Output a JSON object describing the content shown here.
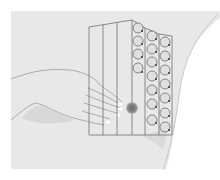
{
  "illustration": {
    "subject": "breast self-examination vertical strip pattern",
    "background_color": "#e6e6e6",
    "body_color": "#dcdcdc",
    "line_color": "#6e6e6e",
    "arrow_color": "#5a5a5a",
    "lump_color": "#7a7a7a",
    "strips": {
      "count": 6,
      "straight_strips": 3,
      "circle_strips": 3,
      "circles_per_strip": [
        4,
        7,
        7
      ]
    },
    "elements": [
      "torso",
      "breast",
      "hand-fingers",
      "vertical-strip-grid",
      "circular-motion-arrows",
      "lump-marker"
    ]
  }
}
